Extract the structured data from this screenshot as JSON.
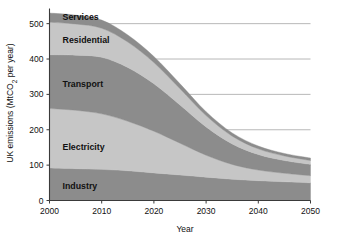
{
  "chart_data": {
    "type": "area",
    "stacked": true,
    "title": "",
    "xlabel": "Year",
    "ylabel": "UK emissions (MtCO₂ per year)",
    "xlim": [
      2000,
      2050
    ],
    "ylim": [
      0,
      540
    ],
    "xticks": [
      2000,
      2010,
      2020,
      2030,
      2040,
      2050
    ],
    "xtick_labels": [
      "2000",
      "2010",
      "2020",
      "2030",
      "2040",
      "2050"
    ],
    "yticks": [
      0,
      100,
      200,
      300,
      400,
      500
    ],
    "ytick_labels": [
      "0",
      "100",
      "200",
      "300",
      "400",
      "500"
    ],
    "grid": "horizontal",
    "legend_position": "inline-labels",
    "x": [
      2000,
      2005,
      2010,
      2015,
      2020,
      2025,
      2030,
      2035,
      2040,
      2045,
      2050
    ],
    "series": [
      {
        "name": "Industry",
        "order": 1,
        "color": "#8c8c8c",
        "label_x": 2002.5,
        "label_y": 40,
        "values": [
          92,
          90,
          88,
          84,
          78,
          72,
          66,
          60,
          56,
          53,
          50
        ]
      },
      {
        "name": "Electricity",
        "order": 2,
        "color": "#c6c6c6",
        "label_x": 2002.5,
        "label_y": 150,
        "values": [
          168,
          165,
          157,
          140,
          118,
          90,
          62,
          42,
          30,
          24,
          20
        ]
      },
      {
        "name": "Transport",
        "order": 3,
        "color": "#8c8c8c",
        "label_x": 2002.5,
        "label_y": 330,
        "values": [
          152,
          156,
          160,
          152,
          134,
          108,
          80,
          58,
          44,
          36,
          32
        ]
      },
      {
        "name": "Residential",
        "order": 4,
        "color": "#c6c6c6",
        "label_x": 2002.5,
        "label_y": 455,
        "values": [
          92,
          88,
          82,
          72,
          60,
          46,
          32,
          22,
          16,
          13,
          11
        ]
      },
      {
        "name": "Services",
        "order": 5,
        "color": "#8c8c8c",
        "label_x": 2002.5,
        "label_y": 518,
        "values": [
          26,
          25,
          23,
          20,
          17,
          14,
          11,
          9,
          8,
          7,
          7
        ]
      }
    ],
    "totals": [
      530,
      524,
      510,
      468,
      407,
      330,
      251,
      191,
      154,
      133,
      120
    ]
  },
  "colors": {
    "band_dark": "#8c8c8c",
    "band_light": "#c6c6c6",
    "axis": "#3a3a3a",
    "grid": "#9a9a9a",
    "text": "#111111",
    "background": "#ffffff"
  }
}
